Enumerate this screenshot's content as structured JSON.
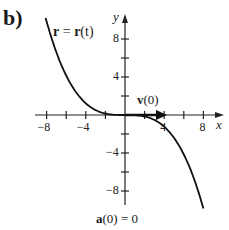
{
  "panel_label": "b)",
  "curve_label_bold": "r",
  "curve_label_eq": " = ",
  "curve_label_rhs_bold": "r",
  "curve_label_rhs_arg": "(t)",
  "velocity_label_bold": "v",
  "velocity_label_arg": "(0)",
  "accel_label_bold": "a",
  "accel_label_rest": "(0) = 0",
  "chart_data": {
    "type": "line",
    "title": "",
    "xlabel": "x",
    "ylabel": "y",
    "xlim": [
      -9.5,
      10
    ],
    "ylim": [
      -10,
      10
    ],
    "x_ticks": [
      -8,
      -6,
      -4,
      -2,
      2,
      4,
      6,
      8
    ],
    "x_tick_labels": [
      {
        "v": -8,
        "t": "−8"
      },
      {
        "v": -4,
        "t": "−4"
      },
      {
        "v": 4,
        "t": "4"
      },
      {
        "v": 8,
        "t": "8"
      }
    ],
    "y_ticks": [
      -8,
      -6,
      -4,
      -2,
      2,
      4,
      6,
      8
    ],
    "y_tick_labels": [
      {
        "v": 8,
        "t": "8"
      },
      {
        "v": 4,
        "t": "4"
      },
      {
        "v": -4,
        "t": "−4"
      },
      {
        "v": -8,
        "t": "−8"
      }
    ],
    "grid": false,
    "series": [
      {
        "name": "r = r(t)",
        "description": "cubic-like curve y ≈ -x^3/64 passing through origin with horizontal tangent",
        "x": [
          -8,
          -6,
          -4,
          -2,
          0,
          2,
          4,
          6,
          8
        ],
        "y": [
          10,
          3.4,
          1,
          0.1,
          0,
          -0.1,
          -1,
          -3.4,
          -8
        ]
      }
    ],
    "annotations": [
      {
        "text": "v(0)",
        "type": "vector",
        "from": [
          0,
          0
        ],
        "to": [
          4,
          0
        ]
      },
      {
        "text": "a(0) = 0",
        "position": "below plot"
      }
    ]
  }
}
